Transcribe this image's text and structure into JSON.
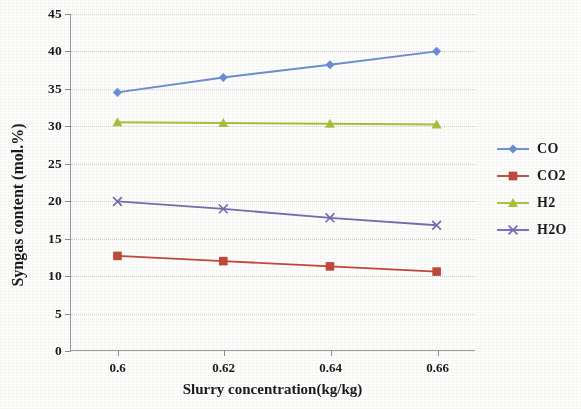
{
  "chart_data": {
    "type": "line",
    "title": "",
    "xlabel": "Slurry concentration(kg/kg)",
    "ylabel": "Syngas content (mol.%)",
    "categories": [
      "0.6",
      "0.62",
      "0.64",
      "0.66"
    ],
    "ylim": [
      0,
      45
    ],
    "yticks": [
      "0",
      "5",
      "10",
      "15",
      "20",
      "25",
      "30",
      "35",
      "40",
      "45"
    ],
    "ytick_values": [
      0,
      5,
      10,
      15,
      20,
      25,
      30,
      35,
      40,
      45
    ],
    "grid": "horizontal-dotted",
    "legend_position": "right",
    "series": [
      {
        "name": "CO",
        "color": "#6b8fd4",
        "marker": "diamond",
        "values": [
          34.5,
          36.5,
          38.2,
          40.0
        ]
      },
      {
        "name": "CO2",
        "color": "#c0493a",
        "marker": "square",
        "values": [
          12.6,
          11.9,
          11.2,
          10.5
        ]
      },
      {
        "name": "H2",
        "color": "#a8c13c",
        "marker": "triangle",
        "values": [
          30.5,
          30.4,
          30.3,
          30.2
        ]
      },
      {
        "name": "H2O",
        "color": "#7a6bb0",
        "marker": "cross",
        "values": [
          19.9,
          18.9,
          17.7,
          16.7
        ]
      }
    ]
  },
  "legend": {
    "items": [
      {
        "label": "CO"
      },
      {
        "label": "CO2"
      },
      {
        "label": "H2"
      },
      {
        "label": "H2O"
      }
    ]
  },
  "colors": {
    "axis": "#9a9a9a",
    "grid": "#d2d2d2",
    "text": "#1a1a1a",
    "background": "#ffffff"
  }
}
